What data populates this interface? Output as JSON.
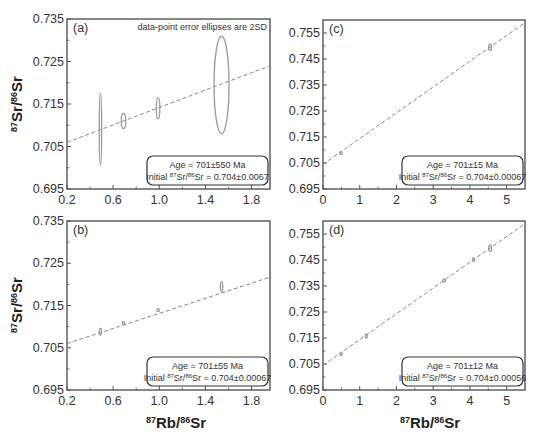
{
  "note": "data-point error ellipses are 2SD",
  "axis": {
    "ylabel": {
      "sup1": "87",
      "main1": "Sr/",
      "sup2": "86",
      "main2": "Sr"
    },
    "xlabel": {
      "sup1": "87",
      "main1": "Rb/",
      "sup2": "86",
      "main2": "Sr"
    }
  },
  "chart_data": [
    {
      "type": "scatter",
      "panel": "(a)",
      "title": "",
      "annotation": "data-point error ellipses are 2SD",
      "xlabel": "87Rb/86Sr",
      "ylabel": "87Sr/86Sr",
      "xlim": [
        0.2,
        1.96
      ],
      "ylim": [
        0.695,
        0.735
      ],
      "xticks": [
        "0.2",
        "0.6",
        "1.0",
        "1.4",
        "1.8"
      ],
      "yticks": [
        "0.695",
        "0.705",
        "0.715",
        "0.725",
        "0.735"
      ],
      "points": [
        {
          "x": 0.49,
          "y": 0.709,
          "x_err": 0.01,
          "y_err": 0.0085
        },
        {
          "x": 0.69,
          "y": 0.711,
          "x_err": 0.02,
          "y_err": 0.0018
        },
        {
          "x": 0.99,
          "y": 0.714,
          "x_err": 0.015,
          "y_err": 0.0025
        },
        {
          "x": 1.54,
          "y": 0.7195,
          "x_err": 0.065,
          "y_err": 0.0115
        }
      ],
      "isochron": {
        "x": [
          0.2,
          1.96
        ],
        "y": [
          0.706,
          0.724
        ]
      },
      "result": {
        "age": "Age = 701±550 Ma",
        "initial_pre": "Initial ",
        "initial_s1": "87",
        "initial_m1": "Sr/",
        "initial_s2": "86",
        "initial_m2": "Sr = 0.704±0.0067"
      }
    },
    {
      "type": "scatter",
      "panel": "(b)",
      "xlabel": "87Rb/86Sr",
      "ylabel": "87Sr/86Sr",
      "xlim": [
        0.2,
        1.96
      ],
      "ylim": [
        0.695,
        0.735
      ],
      "xticks": [
        "0.2",
        "0.6",
        "1.0",
        "1.4",
        "1.8"
      ],
      "yticks": [
        "0.695",
        "0.705",
        "0.715",
        "0.725",
        "0.735"
      ],
      "points": [
        {
          "x": 0.49,
          "y": 0.7088,
          "x_err": 0.004,
          "y_err": 0.0008
        },
        {
          "x": 0.69,
          "y": 0.7108,
          "x_err": 0.003,
          "y_err": 0.0003
        },
        {
          "x": 0.99,
          "y": 0.7139,
          "x_err": 0.003,
          "y_err": 0.0003
        },
        {
          "x": 1.54,
          "y": 0.7194,
          "x_err": 0.006,
          "y_err": 0.0012
        }
      ],
      "isochron": {
        "x": [
          0.2,
          1.96
        ],
        "y": [
          0.706,
          0.7217
        ]
      },
      "result": {
        "age": "Age = 701±55 Ma",
        "initial_pre": "Initial ",
        "initial_s1": "87",
        "initial_m1": "Sr/",
        "initial_s2": "86",
        "initial_m2": "Sr = 0.704±0.00067"
      }
    },
    {
      "type": "scatter",
      "panel": "(c)",
      "xlabel": "",
      "ylabel": "",
      "xlim": [
        0,
        5.5
      ],
      "ylim": [
        0.695,
        0.76
      ],
      "xticks": [
        "0",
        "1",
        "2",
        "3",
        "4",
        "5"
      ],
      "yticks": [
        "0.695",
        "0.705",
        "0.715",
        "0.725",
        "0.735",
        "0.745",
        "0.755"
      ],
      "points": [
        {
          "x": 0.49,
          "y": 0.7088,
          "x_err": 0.01,
          "y_err": 0.0006
        },
        {
          "x": 4.55,
          "y": 0.7495,
          "x_err": 0.04,
          "y_err": 0.0012
        }
      ],
      "isochron": {
        "x": [
          0,
          5.5
        ],
        "y": [
          0.7045,
          0.759
        ]
      },
      "result": {
        "age": "Age = 701±15 Ma",
        "initial_pre": "Initial ",
        "initial_s1": "87",
        "initial_m1": "Sr/",
        "initial_s2": "86",
        "initial_m2": "Sr = 0.704±0.00067"
      }
    },
    {
      "type": "scatter",
      "panel": "(d)",
      "xlabel": "87Rb/86Sr",
      "ylabel": "",
      "xlim": [
        0,
        5.5
      ],
      "ylim": [
        0.695,
        0.76
      ],
      "xticks": [
        "0",
        "1",
        "2",
        "3",
        "4",
        "5"
      ],
      "yticks": [
        "0.695",
        "0.705",
        "0.715",
        "0.725",
        "0.735",
        "0.745",
        "0.755"
      ],
      "points": [
        {
          "x": 0.49,
          "y": 0.7088,
          "x_err": 0.02,
          "y_err": 0.0006
        },
        {
          "x": 1.18,
          "y": 0.7158,
          "x_err": 0.02,
          "y_err": 0.0008
        },
        {
          "x": 3.3,
          "y": 0.7371,
          "x_err": 0.03,
          "y_err": 0.0006
        },
        {
          "x": 4.1,
          "y": 0.7451,
          "x_err": 0.03,
          "y_err": 0.0007
        },
        {
          "x": 4.55,
          "y": 0.7495,
          "x_err": 0.04,
          "y_err": 0.0012
        }
      ],
      "isochron": {
        "x": [
          0,
          5.5
        ],
        "y": [
          0.7045,
          0.759
        ]
      },
      "result": {
        "age": "Age = 701±12 Ma",
        "initial_pre": "Initial ",
        "initial_s1": "87",
        "initial_m1": "Sr/",
        "initial_s2": "86",
        "initial_m2": "Sr = 0.704±0.00056"
      }
    }
  ]
}
